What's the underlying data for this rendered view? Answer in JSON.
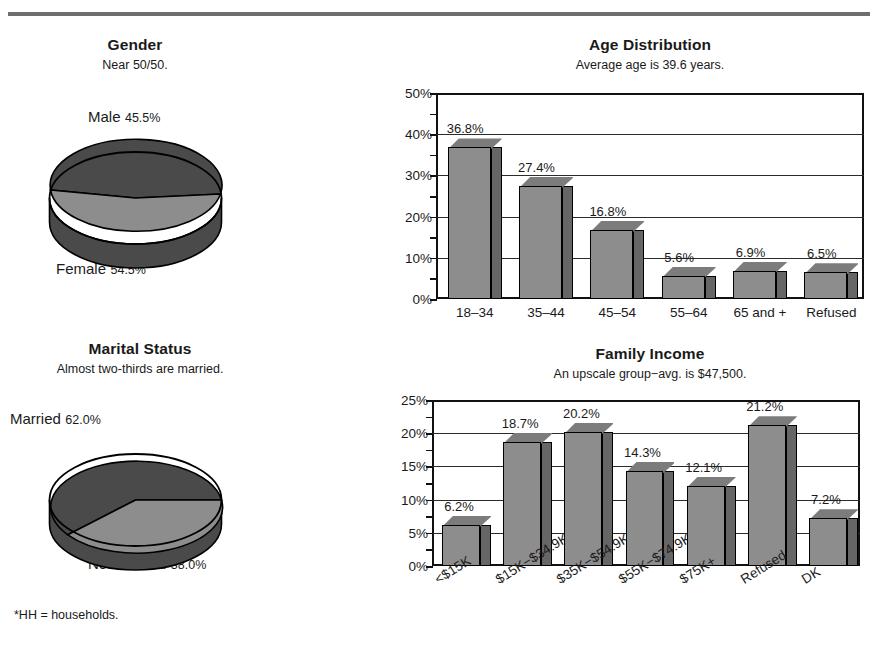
{
  "footnote": "*HH = households.",
  "colors": {
    "bar_front": "#8d8d8d",
    "bar_side": "#666666",
    "pie_dark": "#4a4a4a",
    "pie_light": "#8d8d8d",
    "rule": "#6e6e6e",
    "text": "#1a1a1a"
  },
  "gender": {
    "title": "Gender",
    "subtitle": "Near 50/50.",
    "type": "pie",
    "slices": [
      {
        "label": "Male",
        "value": 45.5,
        "value_text": "45.5%",
        "shade": "dark"
      },
      {
        "label": "Female",
        "value": 54.5,
        "value_text": "54.5%",
        "shade": "light"
      }
    ]
  },
  "marital": {
    "title": "Marital Status",
    "subtitle": "Almost two-thirds are married.",
    "type": "pie",
    "slices": [
      {
        "label": "Married",
        "value": 62.0,
        "value_text": "62.0%",
        "shade": "dark"
      },
      {
        "label": "Not married",
        "value": 38.0,
        "value_text": "38.0%",
        "shade": "light"
      }
    ]
  },
  "age": {
    "title": "Age Distribution",
    "subtitle": "Average age is 39.6 years."
  },
  "income": {
    "title": "Family Income",
    "subtitle": "An upscale group−avg. is $47,500."
  },
  "chart_data": [
    {
      "type": "pie",
      "title": "Gender",
      "subtitle": "Near 50/50.",
      "categories": [
        "Male",
        "Female"
      ],
      "values": [
        45.5,
        54.5
      ],
      "value_labels": [
        "45.5%",
        "54.5%"
      ],
      "legend": "inline-labels",
      "three_d": true
    },
    {
      "type": "pie",
      "title": "Marital Status",
      "subtitle": "Almost two-thirds are married.",
      "categories": [
        "Married",
        "Not married"
      ],
      "values": [
        62.0,
        38.0
      ],
      "value_labels": [
        "62.0%",
        "38.0%"
      ],
      "legend": "inline-labels",
      "three_d": true
    },
    {
      "type": "bar",
      "title": "Age Distribution",
      "subtitle": "Average age is 39.6 years.",
      "categories": [
        "18–34",
        "35–44",
        "45–54",
        "55–64",
        "65 and +",
        "Refused"
      ],
      "values": [
        36.8,
        27.4,
        16.8,
        5.6,
        6.9,
        6.5
      ],
      "value_labels": [
        "36.8%",
        "27.4%",
        "16.8%",
        "5.6%",
        "6.9%",
        "6.5%"
      ],
      "xlabel": "",
      "ylabel": "",
      "ylim": [
        0,
        50
      ],
      "yticks": [
        0,
        10,
        20,
        30,
        40,
        50
      ],
      "ytick_labels": [
        "0%",
        "10%",
        "20%",
        "30%",
        "40%",
        "50%"
      ],
      "minor_tick_step": 5,
      "grid": true,
      "three_d": true
    },
    {
      "type": "bar",
      "title": "Family Income",
      "subtitle": "An upscale group−avg. is $47,500.",
      "categories": [
        "<$15K",
        "$15K−$34.9K",
        "$35K−$54.9K",
        "$55K−$74.9K",
        "$75K+",
        "Refused",
        "DK"
      ],
      "values": [
        6.2,
        18.7,
        20.2,
        14.3,
        12.1,
        21.2,
        7.2
      ],
      "value_labels": [
        "6.2%",
        "18.7%",
        "20.2%",
        "14.3%",
        "12.1%",
        "21.2%",
        "7.2%"
      ],
      "xlabel": "",
      "ylabel": "",
      "ylim": [
        0,
        25
      ],
      "yticks": [
        0,
        5,
        10,
        15,
        20,
        25
      ],
      "ytick_labels": [
        "0%",
        "5%",
        "10%",
        "15%",
        "20%",
        "25%"
      ],
      "minor_tick_step": 2.5,
      "grid": true,
      "three_d": true
    }
  ]
}
